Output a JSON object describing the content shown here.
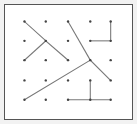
{
  "figure": {
    "type": "dot-grid-line-figure",
    "background_color": "#ffffff",
    "frame_color": "#f2f2f2",
    "border_color": "#555555",
    "dot_color": "#444444",
    "line_color": "#777777",
    "canvas": {
      "width": 137,
      "height": 124
    },
    "plot_area": {
      "x": 5,
      "y": 5,
      "width": 127,
      "height": 114
    }
  },
  "grid": {
    "rows": 5,
    "columns": 5,
    "column_x": [
      21,
      44,
      68,
      92,
      114
    ],
    "row_y": [
      18,
      39,
      60,
      82,
      103
    ],
    "dot_radius": 1.3,
    "dots": [
      {
        "col": 0,
        "row": 0,
        "x": 21,
        "y": 18
      },
      {
        "col": 1,
        "row": 0,
        "x": 44,
        "y": 18
      },
      {
        "col": 2,
        "row": 0,
        "x": 68,
        "y": 18
      },
      {
        "col": 3,
        "row": 0,
        "x": 92,
        "y": 18
      },
      {
        "col": 4,
        "row": 0,
        "x": 114,
        "y": 18
      },
      {
        "col": 0,
        "row": 1,
        "x": 21,
        "y": 39
      },
      {
        "col": 1,
        "row": 1,
        "x": 44,
        "y": 39
      },
      {
        "col": 2,
        "row": 1,
        "x": 68,
        "y": 39
      },
      {
        "col": 3,
        "row": 1,
        "x": 92,
        "y": 39
      },
      {
        "col": 4,
        "row": 1,
        "x": 114,
        "y": 39
      },
      {
        "col": 0,
        "row": 2,
        "x": 21,
        "y": 60
      },
      {
        "col": 1,
        "row": 2,
        "x": 44,
        "y": 60
      },
      {
        "col": 2,
        "row": 2,
        "x": 68,
        "y": 60
      },
      {
        "col": 3,
        "row": 2,
        "x": 92,
        "y": 60
      },
      {
        "col": 4,
        "row": 2,
        "x": 114,
        "y": 60
      },
      {
        "col": 0,
        "row": 3,
        "x": 21,
        "y": 82
      },
      {
        "col": 1,
        "row": 3,
        "x": 44,
        "y": 82
      },
      {
        "col": 2,
        "row": 3,
        "x": 68,
        "y": 82
      },
      {
        "col": 3,
        "row": 3,
        "x": 92,
        "y": 82
      },
      {
        "col": 4,
        "row": 3,
        "x": 114,
        "y": 82
      },
      {
        "col": 0,
        "row": 4,
        "x": 21,
        "y": 103
      },
      {
        "col": 1,
        "row": 4,
        "x": 44,
        "y": 103
      },
      {
        "col": 2,
        "row": 4,
        "x": 68,
        "y": 103
      },
      {
        "col": 3,
        "row": 4,
        "x": 92,
        "y": 103
      },
      {
        "col": 4,
        "row": 4,
        "x": 114,
        "y": 103
      }
    ]
  },
  "segments": [
    {
      "name": "x-upper-left-stroke",
      "x1": 21,
      "y1": 18,
      "x2": 44,
      "y2": 39
    },
    {
      "name": "x-lower-right-stroke",
      "x1": 44,
      "y1": 39,
      "x2": 68,
      "y2": 60
    },
    {
      "name": "x-lower-left-stroke",
      "x1": 21,
      "y1": 60,
      "x2": 44,
      "y2": 39
    },
    {
      "name": "long-diagonal-top-right-to-bottom-center",
      "x1": 68,
      "y1": 18,
      "x2": 92,
      "y2": 60
    },
    {
      "name": "long-diagonal-center-to-bottom-right",
      "x1": 92,
      "y1": 60,
      "x2": 114,
      "y2": 82
    },
    {
      "name": "long-diagonal-bottom-left-to-center",
      "x1": 21,
      "y1": 103,
      "x2": 92,
      "y2": 60
    },
    {
      "name": "corner-bracket-vertical-top-right",
      "x1": 114,
      "y1": 18,
      "x2": 114,
      "y2": 39
    },
    {
      "name": "corner-bracket-horizontal-top-right",
      "x1": 92,
      "y1": 39,
      "x2": 114,
      "y2": 39
    },
    {
      "name": "tee-horizontal-bottom-right",
      "x1": 68,
      "y1": 103,
      "x2": 114,
      "y2": 103
    },
    {
      "name": "tee-vertical-stem-bottom-right",
      "x1": 92,
      "y1": 82,
      "x2": 92,
      "y2": 103
    }
  ]
}
